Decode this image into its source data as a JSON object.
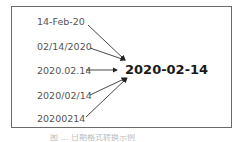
{
  "diagram": {
    "sources": [
      {
        "label": "14-Feb-20"
      },
      {
        "label": "02/14/2020"
      },
      {
        "label": "2020.02.14"
      },
      {
        "label": "2020/02/14"
      },
      {
        "label": "20200214"
      }
    ],
    "target": {
      "label": "2020-02-14"
    },
    "caption": "图 ... 日期格式转换示例"
  }
}
